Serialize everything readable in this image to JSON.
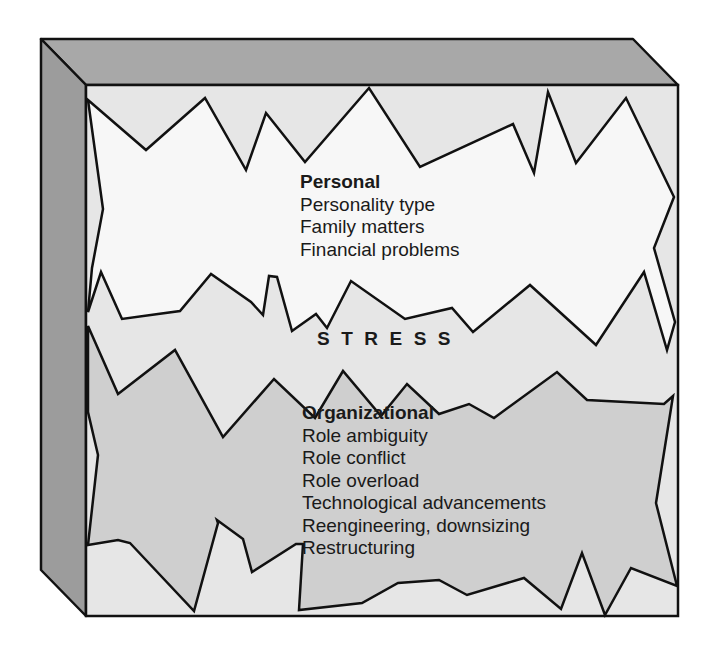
{
  "diagram": {
    "center_label": "STRESS",
    "personal": {
      "heading": "Personal",
      "items": [
        "Personality type",
        "Family matters",
        "Financial problems"
      ]
    },
    "organizational": {
      "heading": "Organizational",
      "items": [
        "Role ambiguity",
        "Role conflict",
        "Role overload",
        "Technological advancements",
        "Reengineering, downsizing",
        "Restructuring"
      ]
    },
    "colors": {
      "frame_top": "#a6a6a6",
      "frame_side": "#9c9c9c",
      "face_background": "#e6e6e6",
      "personal_fill": "#f7f7f7",
      "organizational_fill": "#cfcfcf",
      "outline": "#111111"
    }
  }
}
